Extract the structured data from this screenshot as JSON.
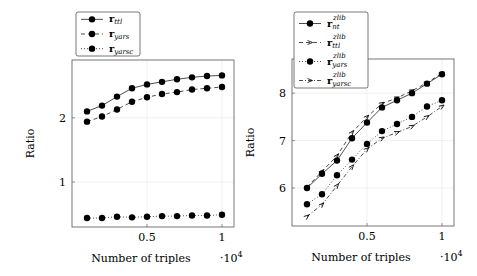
{
  "chart_data": [
    {
      "type": "line",
      "xlabel": "Number of triples",
      "ylabel": "Ratio",
      "x_multiplier": "·10^4",
      "x_multiplier_base": "·10",
      "x_multiplier_exp": "4",
      "xticks": [
        0.5,
        1
      ],
      "xtick_labels": [
        "0.5",
        "1"
      ],
      "yticks": [
        1,
        2
      ],
      "ytick_labels": [
        "1",
        "2"
      ],
      "xlim": [
        0.0,
        1.08
      ],
      "ylim": [
        0.3,
        2.9
      ],
      "grid": true,
      "legend_position": "above-left",
      "x": [
        0.1,
        0.2,
        0.3,
        0.4,
        0.5,
        0.6,
        0.7,
        0.8,
        0.9,
        1.0
      ],
      "series": [
        {
          "name": "r_ttl",
          "label_base": "r",
          "label_sub": "ttl",
          "label_sup": "",
          "style": "solid",
          "marker": "circle",
          "values": [
            2.1,
            2.19,
            2.33,
            2.46,
            2.52,
            2.56,
            2.6,
            2.63,
            2.65,
            2.66
          ]
        },
        {
          "name": "r_yars",
          "label_base": "r",
          "label_sub": "yars",
          "label_sup": "",
          "style": "dashed",
          "marker": "circle",
          "values": [
            1.94,
            2.02,
            2.13,
            2.25,
            2.32,
            2.37,
            2.4,
            2.44,
            2.46,
            2.48
          ]
        },
        {
          "name": "r_yarsc",
          "label_base": "r",
          "label_sub": "yarsc",
          "label_sup": "",
          "style": "dotted",
          "marker": "circle",
          "values": [
            0.44,
            0.44,
            0.46,
            0.45,
            0.46,
            0.47,
            0.47,
            0.48,
            0.48,
            0.49
          ]
        }
      ]
    },
    {
      "type": "line",
      "xlabel": "Number of triples",
      "ylabel": "Ratio",
      "x_multiplier": "·10^4",
      "x_multiplier_base": "·10",
      "x_multiplier_exp": "4",
      "xticks": [
        0.5,
        1
      ],
      "xtick_labels": [
        "0.5",
        "1"
      ],
      "yticks": [
        6,
        7,
        8
      ],
      "ytick_labels": [
        "6",
        "7",
        "8"
      ],
      "xlim": [
        0.0,
        1.08
      ],
      "ylim": [
        5.2,
        8.72
      ],
      "grid": true,
      "legend_position": "above-left",
      "x": [
        0.1,
        0.2,
        0.3,
        0.4,
        0.5,
        0.6,
        0.7,
        0.8,
        0.9,
        1.0
      ],
      "series": [
        {
          "name": "r_nt^zlib",
          "label_base": "r",
          "label_sub": "nt",
          "label_sup": "zlib",
          "style": "solid",
          "marker": "circle",
          "values": [
            6.0,
            6.3,
            6.58,
            7.05,
            7.38,
            7.7,
            7.85,
            8.0,
            8.2,
            8.4
          ]
        },
        {
          "name": "r_ttl^zlib",
          "label_base": "r",
          "label_sub": "ttl",
          "label_sup": "zlib",
          "style": "dashed",
          "marker": "arrow",
          "values": [
            6.02,
            6.35,
            6.68,
            7.17,
            7.5,
            7.78,
            7.9,
            8.05,
            8.22,
            8.42
          ]
        },
        {
          "name": "r_yars^zlib",
          "label_base": "r",
          "label_sub": "yars",
          "label_sup": "zlib",
          "style": "dotted",
          "marker": "circle",
          "values": [
            5.66,
            5.87,
            6.27,
            6.6,
            6.93,
            7.2,
            7.35,
            7.5,
            7.72,
            7.85
          ]
        },
        {
          "name": "r_yarsc^zlib",
          "label_base": "r",
          "label_sub": "yarsc",
          "label_sup": "zlib",
          "style": "dashdot",
          "marker": "arrow",
          "values": [
            5.4,
            5.65,
            6.05,
            6.45,
            6.82,
            7.05,
            7.17,
            7.3,
            7.5,
            7.72
          ]
        }
      ]
    }
  ],
  "layout": {
    "panels": [
      {
        "axes": {
          "left": 72,
          "top": 60,
          "right": 234,
          "bottom": 227
        },
        "legend": {
          "left": 76,
          "top": 12,
          "width": 64,
          "height": 44
        }
      },
      {
        "axes": {
          "left": 292,
          "top": 59,
          "right": 454,
          "bottom": 226
        },
        "legend": {
          "left": 294,
          "top": 12,
          "width": 74,
          "height": 76
        }
      }
    ]
  }
}
